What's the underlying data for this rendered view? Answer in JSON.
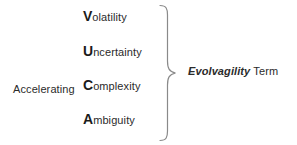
{
  "diagram": {
    "background_color": "#ffffff",
    "text_color": "#2b2b2b",
    "modifier": {
      "label": "Accelerating"
    },
    "vuca_items": [
      {
        "initial": "V",
        "rest": "olatility",
        "full": "Volatility"
      },
      {
        "initial": "U",
        "rest": "ncertainty",
        "full": "Uncertainty"
      },
      {
        "initial": "C",
        "rest": "omplexity",
        "full": "Complexity"
      },
      {
        "initial": "A",
        "rest": "mbiguity",
        "full": "Ambiguity"
      }
    ],
    "brace": {
      "name": "right-curly-brace",
      "color": "#8a8a8a"
    },
    "term": {
      "name": "Evolvagility",
      "word": "Term",
      "full": "Evolvagility Term"
    }
  }
}
